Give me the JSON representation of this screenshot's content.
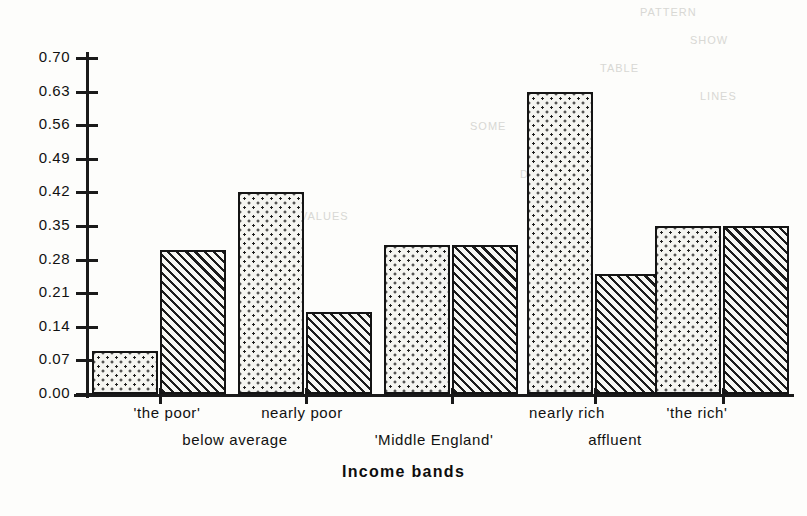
{
  "chart_data": {
    "type": "bar",
    "title": "",
    "xlabel": "Income bands",
    "ylabel": "",
    "ylim": [
      0.0,
      0.7
    ],
    "ytick_labels": [
      "0.70",
      "0.63",
      "0.56",
      "0.49",
      "0.42",
      "0.35",
      "0.28",
      "0.21",
      "0.14",
      "0.07",
      "0.00"
    ],
    "ytick_values": [
      0.7,
      0.63,
      0.56,
      0.49,
      0.42,
      0.35,
      0.28,
      0.21,
      0.14,
      0.07,
      0.0
    ],
    "grid": false,
    "legend": "none",
    "categories": [
      "'the poor' / below average",
      "nearly poor",
      "'Middle England'",
      "nearly rich / affluent",
      "'the rich'"
    ],
    "series": [
      {
        "name": "dotted",
        "fill": "stipple",
        "values": [
          0.09,
          0.42,
          0.31,
          0.63,
          0.35
        ]
      },
      {
        "name": "hatched",
        "fill": "diagonal-hatch",
        "values": [
          0.3,
          0.17,
          0.31,
          0.25,
          0.35
        ]
      }
    ],
    "bars": [
      {
        "index": 1,
        "fill": "stipple",
        "value": 0.09
      },
      {
        "index": 2,
        "fill": "diagonal-hatch",
        "value": 0.3
      },
      {
        "index": 3,
        "fill": "stipple",
        "value": 0.42
      },
      {
        "index": 4,
        "fill": "diagonal-hatch",
        "value": 0.17
      },
      {
        "index": 5,
        "fill": "stipple",
        "value": 0.31
      },
      {
        "index": 6,
        "fill": "diagonal-hatch",
        "value": 0.31
      },
      {
        "index": 7,
        "fill": "stipple",
        "value": 0.63
      },
      {
        "index": 8,
        "fill": "diagonal-hatch",
        "value": 0.25
      },
      {
        "index": 9,
        "fill": "stipple",
        "value": 0.35
      },
      {
        "index": 10,
        "fill": "diagonal-hatch",
        "value": 0.35
      }
    ],
    "category_labels_top": [
      "'the poor'",
      "nearly poor",
      "nearly rich",
      "'the rich'"
    ],
    "category_labels_bottom": [
      "below average",
      "'Middle England'",
      "affluent"
    ],
    "colors": {
      "axis": "#1a1a1a",
      "bar_outline": "#141414",
      "bar_fill": "#f4f4f0",
      "background": "#fdfdfb"
    }
  },
  "axis": {
    "x_title": "Income bands"
  },
  "labels": {
    "the_poor": "'the poor'",
    "below_average": "below average",
    "nearly_poor": "nearly poor",
    "middle_england": "'Middle England'",
    "nearly_rich": "nearly rich",
    "affluent": "affluent",
    "the_rich": "'the rich'"
  },
  "ghost_text": {
    "g1": "PATTERN",
    "g2": "SHOW",
    "g3": "TABLE",
    "g4": "LINES",
    "g5": "SOME",
    "g6": "DATA",
    "g7": "VALUES"
  }
}
